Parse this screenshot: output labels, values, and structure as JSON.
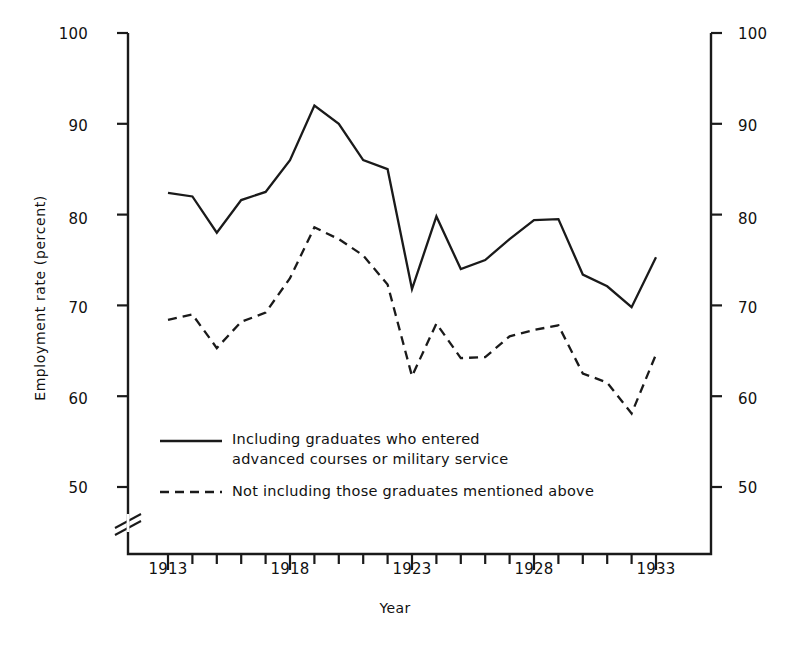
{
  "chart_data": {
    "type": "line",
    "title": "",
    "xlabel": "Year",
    "ylabel": "Employment rate (percent)",
    "xlim": [
      1912,
      1934
    ],
    "ylim": [
      46,
      100
    ],
    "ylim_display": [
      50,
      100
    ],
    "axis_break": true,
    "grid": false,
    "legend_position": "inside-lower-left",
    "yticks": [
      50,
      60,
      70,
      80,
      90,
      100
    ],
    "ytick_labels": [
      "50",
      "60",
      "70",
      "80",
      "90",
      "100"
    ],
    "ytick_labels_right": [
      "50",
      "60",
      "70",
      "80",
      "90",
      "100"
    ],
    "xticks": [
      1913,
      1914,
      1915,
      1916,
      1917,
      1918,
      1919,
      1920,
      1921,
      1922,
      1923,
      1924,
      1925,
      1926,
      1927,
      1928,
      1929,
      1930,
      1931,
      1932,
      1933
    ],
    "xtick_labels_major": [
      "1913",
      "1918",
      "1923",
      "1928",
      "1933"
    ],
    "xticks_major": [
      1913,
      1918,
      1923,
      1928,
      1933
    ],
    "x": [
      1913,
      1914,
      1915,
      1916,
      1917,
      1918,
      1919,
      1920,
      1921,
      1922,
      1923,
      1924,
      1925,
      1926,
      1927,
      1928,
      1929,
      1930,
      1931,
      1932,
      1933
    ],
    "series": [
      {
        "name": "Including graduates who entered advanced courses or military service",
        "style": "solid",
        "color": "#1a1a1a",
        "values": [
          82.4,
          82.0,
          78.0,
          81.6,
          82.5,
          86.0,
          92.0,
          90.0,
          86.0,
          85.0,
          71.8,
          79.8,
          74.0,
          75.0,
          77.3,
          79.4,
          79.5,
          73.4,
          72.1,
          69.8,
          75.3
        ]
      },
      {
        "name": "Not including those graduates mentioned above",
        "style": "dashed",
        "color": "#1a1a1a",
        "values": [
          68.4,
          69.0,
          65.3,
          68.2,
          69.2,
          73.0,
          78.6,
          77.3,
          75.5,
          72.3,
          62.2,
          68.0,
          64.2,
          64.3,
          66.6,
          67.3,
          67.8,
          62.5,
          61.5,
          58.1,
          64.6
        ]
      }
    ]
  },
  "legend": {
    "entries": [
      {
        "style": "solid",
        "label": "Including graduates who entered\nadvanced courses or military service"
      },
      {
        "style": "dashed",
        "label": "Not including those graduates mentioned above"
      }
    ]
  }
}
